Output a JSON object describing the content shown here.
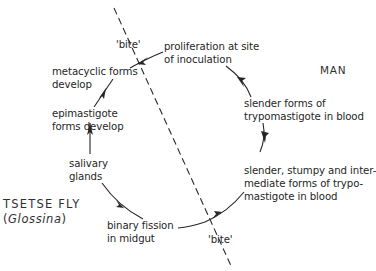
{
  "diagram": {
    "hosts": {
      "man": {
        "label": "MAN"
      },
      "tsetse": {
        "label": "TSETSE FLY",
        "genus_open": "(",
        "genus": "Glossina",
        "genus_close": ")"
      }
    },
    "bite_labels": {
      "top": "'bite'",
      "bottom": "'bite'"
    },
    "stages": [
      {
        "id": "proliferation",
        "lines": [
          "proliferation at site",
          "of inoculation"
        ]
      },
      {
        "id": "slender-forms",
        "lines": [
          "slender forms of",
          "trypomastigote in blood"
        ]
      },
      {
        "id": "mixed-forms",
        "lines": [
          "slender, stumpy and inter-",
          "mediate forms of trypo-",
          "mastigote in blood"
        ]
      },
      {
        "id": "binary-fission",
        "lines": [
          "binary fission",
          "in midgut"
        ]
      },
      {
        "id": "salivary-glands",
        "lines": [
          "salivary",
          "glands"
        ]
      },
      {
        "id": "epimastigote",
        "lines": [
          "epimastigote",
          "forms develop"
        ]
      },
      {
        "id": "metacyclic",
        "lines": [
          "metacyclic forms",
          "develop"
        ]
      }
    ],
    "colors": {
      "ink": "#262626",
      "background": "#ffffff"
    }
  }
}
